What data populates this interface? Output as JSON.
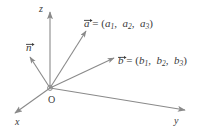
{
  "figure": {
    "background_color": "#ffffff",
    "stroke_color": "#8a8a8a",
    "text_color": "#3a3a3a"
  },
  "axes": [
    {
      "name": "z-axis",
      "label": "z",
      "direction": "up"
    },
    {
      "name": "x-axis",
      "label": "x",
      "direction": "down-left"
    },
    {
      "name": "y-axis",
      "label": "y",
      "direction": "right"
    }
  ],
  "origin": {
    "label": "O"
  },
  "vectors": [
    {
      "name": "n",
      "label": "n",
      "direction": "up-left"
    },
    {
      "name": "a",
      "label": "a",
      "direction": "up-right"
    },
    {
      "name": "b",
      "label": "b",
      "direction": "right"
    }
  ],
  "equations": {
    "a": {
      "symbol": "a",
      "operator": "=",
      "open": "(",
      "close": ")",
      "components": [
        "a",
        "a",
        "a"
      ],
      "subscripts": [
        "1",
        "2",
        "3"
      ],
      "separator": ","
    },
    "b": {
      "symbol": "b",
      "operator": "=",
      "open": "(",
      "close": ")",
      "components": [
        "b",
        "b",
        "b"
      ],
      "subscripts": [
        "1",
        "2",
        "3"
      ],
      "separator": ","
    }
  }
}
